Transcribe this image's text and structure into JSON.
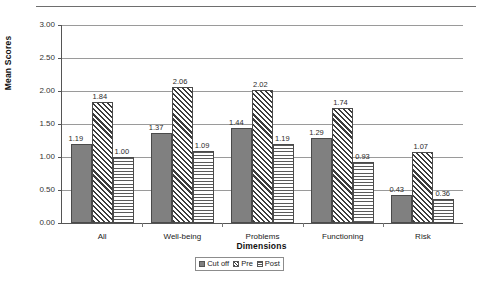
{
  "chart_data": {
    "type": "bar",
    "title": "",
    "xlabel": "Dimensions",
    "ylabel": "Mean Scores",
    "ylim": [
      0.0,
      3.0
    ],
    "ytick_step": 0.5,
    "ytick_labels": [
      "0.00",
      "0.50",
      "1.00",
      "1.50",
      "2.00",
      "2.50",
      "3.00"
    ],
    "grid": true,
    "legend_position": "bottom-center",
    "categories": [
      "All",
      "Well-being",
      "Problems",
      "Functioning",
      "Risk"
    ],
    "series": [
      {
        "name": "Cut off",
        "pattern": "solid-gray",
        "color": "#808080",
        "values": [
          1.19,
          1.37,
          1.44,
          1.29,
          0.43
        ],
        "labels": [
          "1.19",
          "1.37",
          "1.44",
          "1.29",
          "0.43"
        ]
      },
      {
        "name": "Pre",
        "pattern": "diagonal-hatch",
        "color": "#3c3c3c",
        "values": [
          1.84,
          2.06,
          2.02,
          1.74,
          1.07
        ],
        "labels": [
          "1.84",
          "2.06",
          "2.02",
          "1.74",
          "1.07"
        ]
      },
      {
        "name": "Post",
        "pattern": "horizontal-lines",
        "color": "#5a5a5a",
        "values": [
          1.0,
          1.09,
          1.19,
          0.93,
          0.36
        ],
        "labels": [
          "1.00",
          "1.09",
          "1.19",
          "0.93",
          "0.36"
        ]
      }
    ]
  },
  "legend": {
    "items": [
      {
        "label": "Cut off",
        "swatch": "cutoff"
      },
      {
        "label": "Pre",
        "swatch": "pre"
      },
      {
        "label": "Post",
        "swatch": "post"
      }
    ]
  }
}
